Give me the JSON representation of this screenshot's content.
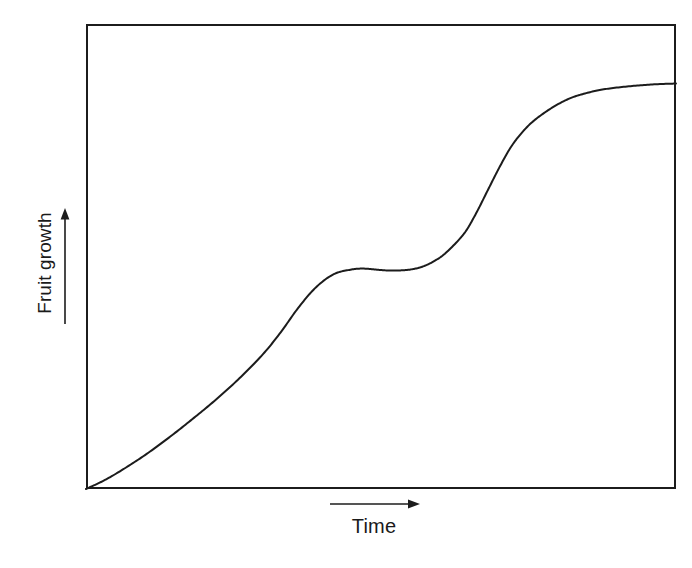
{
  "figure": {
    "background_color": "#ffffff",
    "line_color": "#1c1c1c",
    "frame": {
      "x": 86,
      "y": 24,
      "width": 590,
      "height": 465,
      "border_width": 2,
      "visible_sides": [
        "top",
        "right",
        "bottom",
        "left"
      ]
    }
  },
  "axes": {
    "y": {
      "label": "Fruit growth",
      "arrow": "up-arrow",
      "ticks": [],
      "tick_labels": []
    },
    "x": {
      "label": "Time",
      "arrow": "right-arrow",
      "ticks": [],
      "tick_labels": []
    }
  },
  "caption_fragment": " ",
  "chart_data": {
    "type": "line",
    "title": "",
    "subtitle": "",
    "xlabel": "Time",
    "ylabel": "Fruit growth",
    "xlim": [
      0,
      1
    ],
    "ylim": [
      0,
      1
    ],
    "grid": false,
    "legend": false,
    "legend_position": "none",
    "axis_tick_labels": {
      "x": [],
      "y": []
    },
    "annotations": [],
    "series": [
      {
        "name": "Fruit growth",
        "color": "#1c1c1c",
        "line_width": 2,
        "x": [
          0.0,
          0.03,
          0.06,
          0.1,
          0.14,
          0.18,
          0.22,
          0.26,
          0.3,
          0.33,
          0.36,
          0.39,
          0.42,
          0.45,
          0.47,
          0.49,
          0.51,
          0.53,
          0.55,
          0.57,
          0.59,
          0.61,
          0.64,
          0.66,
          0.68,
          0.7,
          0.72,
          0.74,
          0.76,
          0.79,
          0.82,
          0.85,
          0.88,
          0.92,
          0.96,
          1.0
        ],
        "y": [
          0.0,
          0.018,
          0.04,
          0.073,
          0.11,
          0.15,
          0.192,
          0.238,
          0.29,
          0.337,
          0.39,
          0.434,
          0.462,
          0.472,
          0.474,
          0.472,
          0.47,
          0.47,
          0.472,
          0.478,
          0.49,
          0.508,
          0.548,
          0.59,
          0.64,
          0.69,
          0.735,
          0.768,
          0.793,
          0.82,
          0.84,
          0.852,
          0.86,
          0.866,
          0.87,
          0.872
        ]
      }
    ],
    "phases": [
      {
        "name": "first growth phase",
        "x_range": [
          0.0,
          0.42
        ]
      },
      {
        "name": "plateau / lag phase",
        "x_range": [
          0.42,
          0.6
        ]
      },
      {
        "name": "second growth phase",
        "x_range": [
          0.6,
          0.8
        ]
      },
      {
        "name": "final plateau",
        "x_range": [
          0.8,
          1.0
        ]
      }
    ]
  }
}
